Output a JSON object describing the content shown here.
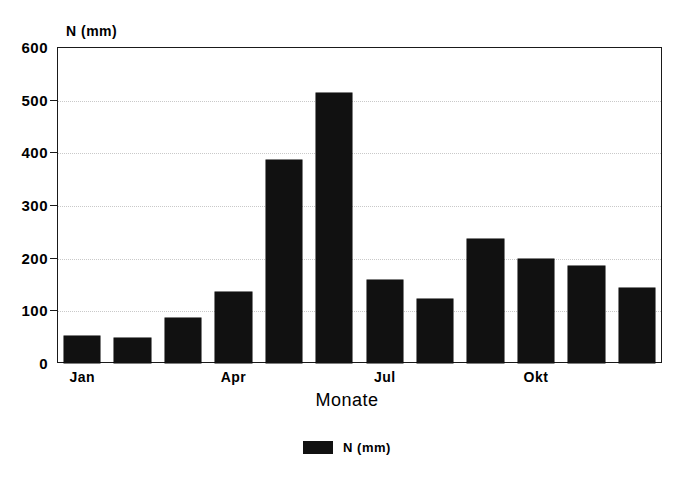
{
  "figure": {
    "title_partial": "",
    "background_color": "#ffffff",
    "bar_color": "#111111",
    "frame_color": "#1a1a1a",
    "gridline_color": "#c9c9c9"
  },
  "legend": {
    "position": "bottom-center",
    "entries": [
      {
        "label": "N (mm)",
        "color": "#111111",
        "swatch_name": "legend-swatch-n-mm"
      }
    ]
  },
  "axes": {
    "y_caption": "N (mm)",
    "x_caption": "Monate",
    "y_ticks": [
      0,
      100,
      200,
      300,
      400,
      500,
      600
    ],
    "y_tick_labels": [
      "0",
      "100",
      "200",
      "300",
      "400",
      "500",
      "600"
    ],
    "x_tick_labels": [
      "Jan",
      "",
      "",
      "Apr",
      "",
      "",
      "Jul",
      "",
      "",
      "Okt",
      "",
      ""
    ]
  },
  "chart_data": {
    "type": "bar",
    "title": "",
    "xlabel": "Monate",
    "ylabel": "N (mm)",
    "ylim": [
      0,
      600
    ],
    "yticks": [
      0,
      100,
      200,
      300,
      400,
      500,
      600
    ],
    "grid": true,
    "legend_position": "bottom-center",
    "categories": [
      "Jan",
      "Feb",
      "Mar",
      "Apr",
      "Mai",
      "Jun",
      "Jul",
      "Aug",
      "Sep",
      "Okt",
      "Nov",
      "Dez"
    ],
    "category_labels_shown": [
      "Jan",
      "Apr",
      "Jul",
      "Okt"
    ],
    "series": [
      {
        "name": "N (mm)",
        "color": "#111111",
        "values": [
          52,
          48,
          86,
          135,
          385,
          512,
          157,
          122,
          235,
          198,
          185,
          143
        ]
      }
    ]
  }
}
